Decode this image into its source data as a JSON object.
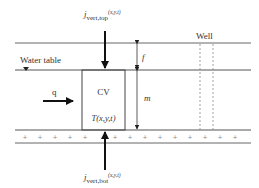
{
  "diagram": {
    "labels": {
      "water_table": "Water table",
      "well": "Well",
      "flow_q": "q",
      "cv": "CV",
      "temperature": "T(x,y,t)",
      "dim_f": "f",
      "dim_m": "m",
      "j_top_main": "j",
      "j_top_sub": "vert,top",
      "j_top_args": "(x,y,t)",
      "j_bot_main": "j",
      "j_bot_sub": "vert,bot",
      "j_bot_args": "(x,y,t)"
    },
    "layers": [
      {
        "name": "unsaturated-zone-top-boundary"
      },
      {
        "name": "water-table"
      },
      {
        "name": "aquifer-bottom"
      },
      {
        "name": "aquitard"
      }
    ],
    "colors": {
      "line": "#555555",
      "arrow": "#111111",
      "text": "#333333"
    }
  }
}
